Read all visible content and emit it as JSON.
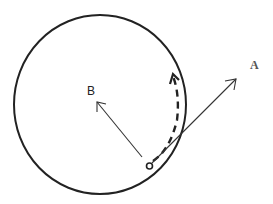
{
  "diagram": {
    "type": "circular-motion",
    "circle": {
      "cx": 100,
      "cy": 104.5,
      "rx": 86,
      "ry": 89.5,
      "stroke": "#222222"
    },
    "object": {
      "cx": 149.5,
      "cy": 166,
      "r": 3
    },
    "vectors": [
      {
        "id": "A",
        "label": "A",
        "from": [
          149,
          166
        ],
        "to": [
          236,
          79
        ],
        "label_pos": [
          254,
          70
        ]
      },
      {
        "id": "B",
        "label": "B",
        "from": [
          142,
          157
        ],
        "to": [
          97,
          102
        ],
        "label_pos": [
          88,
          95
        ]
      }
    ],
    "path": {
      "style": "dashed",
      "description": "motion path along circle toward top-right"
    }
  },
  "labels": {
    "a": "A",
    "b": "B"
  }
}
